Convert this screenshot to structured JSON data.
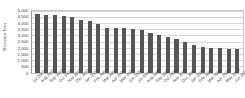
{
  "chart_data": {
    "type": "bar",
    "title": "",
    "subtitle": "",
    "xlabel": "",
    "ylabel": "Thousand Tons",
    "ylim": [
      0,
      5000
    ],
    "grid": true,
    "legend": false,
    "legend_position": "none",
    "bar_color": "#565656",
    "gridline_color": "#d6d6d6",
    "axis_color": "#9a9a9a",
    "text_color": "#3f3f3f",
    "ytick_labels": [
      "5,000",
      "4,500",
      "4,000",
      "3,500",
      "3,000",
      "2,500",
      "2,000",
      "1,500",
      "1,000",
      "500",
      "0"
    ],
    "ytick_values": [
      5000,
      4500,
      4000,
      3500,
      3000,
      2500,
      2000,
      1500,
      1000,
      500,
      0
    ],
    "categories": [
      "Jul 2003",
      "Aug 2003",
      "Sep 2003",
      "Oct 2003",
      "Nov 2003",
      "Dec 2003",
      "Jan 2004",
      "Feb 2004",
      "Mar 2004",
      "Apr 2004",
      "May 2004",
      "Jun 2004",
      "Jul 2004",
      "Aug 2004",
      "Sep 2004",
      "Oct 2004",
      "Nov 2004",
      "Dec 2004",
      "Jan 2005",
      "Feb 2005",
      "Mar 2005",
      "Apr 2005",
      "May 2005",
      "Jun 2005"
    ],
    "values": [
      4700,
      4650,
      4600,
      4520,
      4480,
      4250,
      4150,
      3950,
      3600,
      3580,
      3560,
      3520,
      3400,
      3200,
      3050,
      2900,
      2700,
      2500,
      2200,
      2050,
      2000,
      1950,
      1900,
      1880
    ]
  }
}
